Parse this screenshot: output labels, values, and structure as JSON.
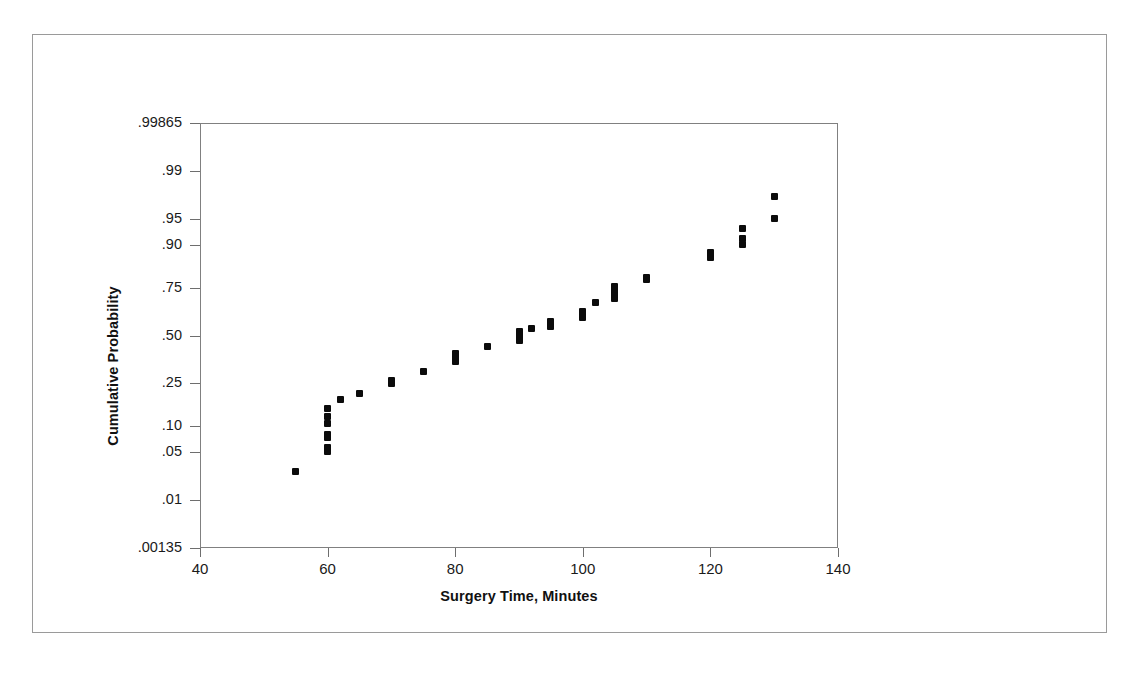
{
  "figure": {
    "border_color": "#9a9a9a",
    "background": "#ffffff"
  },
  "chart_data": {
    "type": "scatter",
    "title": "",
    "subtitle": "",
    "xlabel": "Surgery Time, Minutes",
    "ylabel": "Cumulative Probability",
    "xlim": [
      40,
      140
    ],
    "ylim_probability": [
      0.00135,
      0.99865
    ],
    "yscale": "normal-probability",
    "grid": false,
    "legend": null,
    "legend_position": "none",
    "marker": "square",
    "marker_color": "#0b0b0b",
    "marker_size_px": 7,
    "xticks": [
      40,
      60,
      80,
      100,
      120,
      140
    ],
    "xticklabels": [
      "40",
      "60",
      "80",
      "100",
      "120",
      "140"
    ],
    "yticks_probability": [
      0.00135,
      0.01,
      0.05,
      0.1,
      0.25,
      0.5,
      0.75,
      0.9,
      0.95,
      0.99,
      0.99865
    ],
    "yticks_z": [
      -3.0,
      -2.326,
      -1.645,
      -1.282,
      -0.674,
      0.0,
      0.674,
      1.282,
      1.645,
      2.326,
      3.0
    ],
    "yticklabels": [
      ".00135",
      ".01",
      ".05",
      ".10",
      ".25",
      ".50",
      ".75",
      ".90",
      ".95",
      ".99",
      ".99865"
    ],
    "n_points": 50,
    "x": [
      55,
      60,
      60,
      60,
      60,
      60,
      60,
      60,
      62,
      65,
      70,
      70,
      75,
      80,
      80,
      80,
      80,
      85,
      90,
      90,
      90,
      90,
      92,
      95,
      95,
      95,
      100,
      100,
      100,
      102,
      105,
      105,
      105,
      105,
      110,
      110,
      120,
      120,
      125,
      125,
      125,
      130,
      130
    ],
    "y": [
      0.027,
      0.051,
      0.057,
      0.075,
      0.082,
      0.107,
      0.127,
      0.15,
      0.185,
      0.205,
      0.25,
      0.262,
      0.305,
      0.355,
      0.372,
      0.385,
      0.398,
      0.44,
      0.47,
      0.488,
      0.505,
      0.52,
      0.54,
      0.548,
      0.565,
      0.578,
      0.6,
      0.615,
      0.632,
      0.68,
      0.7,
      0.72,
      0.74,
      0.755,
      0.785,
      0.795,
      0.865,
      0.88,
      0.9,
      0.915,
      0.935,
      0.95,
      0.975
    ],
    "annotations": []
  },
  "axes": {
    "x_axis_name": "surgery-time-axis",
    "y_axis_name": "cumulative-probability-axis"
  }
}
